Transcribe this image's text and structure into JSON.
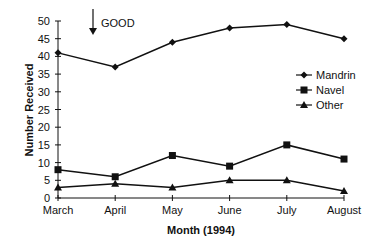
{
  "chart_data": {
    "type": "line",
    "title": "",
    "xlabel": "Month (1994)",
    "ylabel": "Number Received",
    "categories": [
      "March",
      "April",
      "May",
      "June",
      "July",
      "August"
    ],
    "ylim": [
      0,
      50
    ],
    "yticks": [
      0,
      5,
      10,
      15,
      20,
      25,
      30,
      35,
      40,
      45,
      50
    ],
    "grid": false,
    "legend_position": "right-center",
    "series": [
      {
        "name": "Mandrin",
        "marker": "diamond",
        "values": [
          41,
          37,
          44,
          48,
          49,
          45
        ]
      },
      {
        "name": "Navel",
        "marker": "square",
        "values": [
          8,
          6,
          12,
          9,
          15,
          11
        ]
      },
      {
        "name": "Other",
        "marker": "triangle",
        "values": [
          3,
          4,
          3,
          5,
          5,
          2
        ]
      }
    ],
    "annotations": [
      {
        "text": "GOOD",
        "arrow": "down",
        "meaning": "lower is better"
      }
    ]
  },
  "colors": {
    "line": "#111111",
    "background": "#ffffff"
  }
}
